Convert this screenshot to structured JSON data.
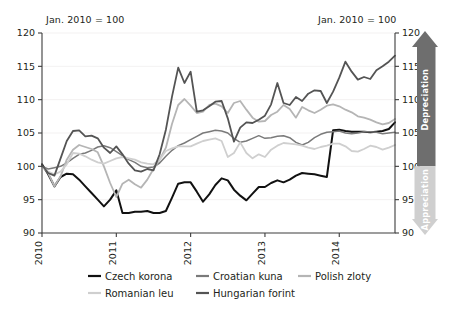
{
  "chart_data": {
    "type": "line",
    "title": "",
    "subtitle": "",
    "note_left": "Jan. 2010 = 100",
    "note_right": "Jan. 2010 = 100",
    "xlabel": "",
    "ylabel": "",
    "ylim": [
      90,
      120
    ],
    "xlim": [
      2010.0,
      2014.75
    ],
    "yticks": [
      90,
      95,
      100,
      105,
      110,
      115,
      120
    ],
    "ytick_labels_left": [
      "90",
      "95",
      "100",
      "105",
      "110",
      "115",
      "120"
    ],
    "ytick_labels_right": [
      "90",
      "95",
      "100",
      "105",
      "110",
      "115",
      "120"
    ],
    "xticks": [
      2010,
      2011,
      2012,
      2013,
      2014
    ],
    "xtick_labels": [
      "2010",
      "2011",
      "2012",
      "2013",
      "2014"
    ],
    "grid": true,
    "legend_position": "bottom",
    "x": [
      2010.0,
      2010.083,
      2010.167,
      2010.25,
      2010.333,
      2010.417,
      2010.5,
      2010.583,
      2010.667,
      2010.75,
      2010.833,
      2010.917,
      2011.0,
      2011.083,
      2011.167,
      2011.25,
      2011.333,
      2011.417,
      2011.5,
      2011.583,
      2011.667,
      2011.75,
      2011.833,
      2011.917,
      2012.0,
      2012.083,
      2012.167,
      2012.25,
      2012.333,
      2012.417,
      2012.5,
      2012.583,
      2012.667,
      2012.75,
      2012.833,
      2012.917,
      2013.0,
      2013.083,
      2013.167,
      2013.25,
      2013.333,
      2013.417,
      2013.5,
      2013.583,
      2013.667,
      2013.75,
      2013.833,
      2013.917,
      2014.0,
      2014.083,
      2014.167,
      2014.25,
      2014.333,
      2014.417,
      2014.5,
      2014.583,
      2014.667,
      2014.75
    ],
    "series": [
      {
        "name": "Czech korona",
        "color": "#111111",
        "width": 2.0,
        "values": [
          100.3,
          98.8,
          97.0,
          98.4,
          98.9,
          98.8,
          98.0,
          97.0,
          96.0,
          95.0,
          94.0,
          95.0,
          96.4,
          93.0,
          93.0,
          93.2,
          93.2,
          93.3,
          93.0,
          93.0,
          93.3,
          95.3,
          97.4,
          97.6,
          97.6,
          96.2,
          94.7,
          95.8,
          97.2,
          98.2,
          97.9,
          96.5,
          95.6,
          94.9,
          95.9,
          96.9,
          96.9,
          97.5,
          97.9,
          97.6,
          98.0,
          98.6,
          99.0,
          98.9,
          98.8,
          98.6,
          98.4,
          105.4,
          105.5,
          105.3,
          105.2,
          105.2,
          105.2,
          105.1,
          105.2,
          105.3,
          105.6,
          106.6
        ]
      },
      {
        "name": "Croatian kuna",
        "color": "#7a7a7a",
        "width": 1.5,
        "values": [
          100.0,
          99.6,
          99.8,
          100.0,
          100.5,
          101.2,
          101.8,
          102.0,
          102.4,
          102.9,
          103.1,
          102.8,
          102.2,
          101.6,
          101.0,
          100.6,
          100.0,
          99.8,
          99.9,
          100.5,
          101.5,
          102.4,
          103.1,
          103.5,
          104.0,
          104.5,
          105.0,
          105.2,
          105.4,
          105.3,
          105.0,
          104.2,
          103.6,
          103.8,
          104.2,
          104.6,
          104.2,
          104.3,
          104.5,
          104.6,
          104.3,
          103.6,
          103.2,
          103.6,
          104.3,
          104.8,
          105.1,
          105.2,
          105.3,
          105.0,
          104.9,
          105.0,
          105.2,
          105.2,
          105.1,
          104.9,
          105.0,
          105.1
        ]
      },
      {
        "name": "Polish zloty",
        "color": "#b5b5b5",
        "width": 1.8,
        "values": [
          100.0,
          99.0,
          97.0,
          98.5,
          101.0,
          102.5,
          103.2,
          102.9,
          102.6,
          102.1,
          100.0,
          97.5,
          95.4,
          97.4,
          98.0,
          97.3,
          96.8,
          98.0,
          99.6,
          101.0,
          102.8,
          106.4,
          109.2,
          110.1,
          109.1,
          108.0,
          108.2,
          109.2,
          109.4,
          109.0,
          108.0,
          109.5,
          109.8,
          108.5,
          107.3,
          106.7,
          106.8,
          107.7,
          108.2,
          109.2,
          108.6,
          107.3,
          108.9,
          108.4,
          108.0,
          108.5,
          109.1,
          109.3,
          109.0,
          108.5,
          108.1,
          107.5,
          107.3,
          107.0,
          106.6,
          106.3,
          106.5,
          107.1
        ]
      },
      {
        "name": "Romanian leu",
        "color": "#cfcfcf",
        "width": 1.8,
        "values": [
          100.0,
          99.2,
          98.8,
          99.2,
          100.3,
          102.0,
          101.9,
          101.5,
          101.0,
          100.6,
          100.4,
          100.8,
          101.2,
          101.4,
          101.2,
          101.0,
          100.6,
          100.4,
          100.3,
          101.0,
          102.3,
          102.7,
          103.0,
          103.0,
          103.0,
          103.4,
          103.8,
          104.0,
          104.2,
          103.8,
          101.4,
          102.0,
          103.6,
          102.0,
          101.2,
          101.8,
          101.4,
          102.5,
          103.1,
          103.5,
          103.4,
          103.3,
          103.1,
          102.8,
          102.6,
          102.9,
          103.1,
          103.4,
          103.4,
          103.0,
          102.3,
          102.2,
          102.6,
          103.1,
          102.9,
          102.5,
          102.8,
          103.2
        ]
      },
      {
        "name": "Hungarian forint",
        "color": "#545454",
        "width": 1.8,
        "values": [
          100.2,
          99.0,
          98.6,
          101.2,
          103.8,
          105.3,
          105.4,
          104.5,
          104.6,
          104.2,
          102.8,
          102.0,
          103.0,
          101.8,
          100.4,
          99.4,
          99.2,
          99.6,
          99.4,
          101.8,
          105.5,
          110.5,
          114.8,
          112.5,
          114.2,
          108.2,
          108.4,
          109.0,
          109.7,
          109.8,
          107.2,
          103.7,
          105.8,
          106.6,
          106.5,
          107.0,
          107.6,
          109.3,
          112.5,
          109.5,
          109.2,
          110.4,
          109.8,
          110.9,
          111.4,
          111.3,
          109.5,
          111.2,
          113.3,
          115.7,
          114.2,
          113.0,
          113.4,
          113.1,
          114.4,
          115.0,
          115.7,
          116.6
        ]
      }
    ],
    "annotations": {
      "depreciation_label": "Depreciation",
      "appreciation_label": "Appreciation",
      "depreciation_color": "#6e6e6e",
      "appreciation_color": "#cfcfcf"
    }
  },
  "legend": {
    "entries": [
      {
        "label": "Czech korona",
        "color": "#111111"
      },
      {
        "label": "Croatian kuna",
        "color": "#7a7a7a"
      },
      {
        "label": "Polish zloty",
        "color": "#b5b5b5"
      },
      {
        "label": "Romanian leu",
        "color": "#cfcfcf"
      },
      {
        "label": "Hungarian forint",
        "color": "#545454"
      }
    ]
  }
}
